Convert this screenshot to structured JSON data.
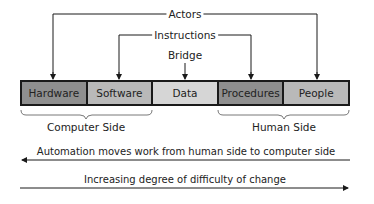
{
  "diagram": {
    "top_labels": {
      "actors": "Actors",
      "instructions": "Instructions",
      "bridge": "Bridge"
    },
    "components": [
      {
        "label": "Hardware",
        "color": "#8f8f8f"
      },
      {
        "label": "Software",
        "color": "#b9b9b9"
      },
      {
        "label": "Data",
        "color": "#d6d6d6"
      },
      {
        "label": "Procedures",
        "color": "#8f8f8f"
      },
      {
        "label": "People",
        "color": "#b9b9b9"
      }
    ],
    "sides": {
      "computer": "Computer Side",
      "human": "Human Side"
    },
    "arrows": {
      "automation": "Automation moves work from human side to computer side",
      "difficulty": "Increasing degree of difficulty of change"
    }
  }
}
